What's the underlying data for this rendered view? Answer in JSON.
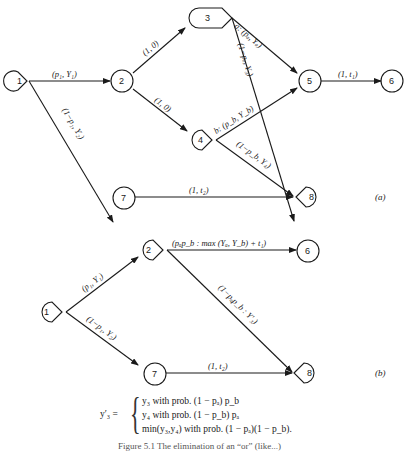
{
  "panel_a": {
    "label": "(a)",
    "nodes": {
      "n1": "1",
      "n2": "2",
      "n3": "3",
      "n4": "4",
      "n5": "5",
      "n6": "6",
      "n7": "7",
      "n8": "8"
    },
    "edges": {
      "e1_2": "(p₁, Y₁)",
      "e1_7": "(1−p₁, Y₂)",
      "e2_3": "(1, 0)",
      "e2_4": "(1, 0)",
      "e3_5": "a: (pₐ, Yₐ)",
      "e3_8": "(1−pₐ, Y₃)",
      "e4_5": "b: (p_b, Y_b)",
      "e4_8": "(1−p_b, Y₄)",
      "e5_6": "(1, t₁)",
      "e7_8": "(1, t₂)"
    }
  },
  "panel_b": {
    "label": "(b)",
    "nodes": {
      "n1": "1",
      "n2": "2",
      "n6": "6",
      "n7": "7",
      "n8": "8"
    },
    "edges": {
      "e1_2": "(p₁, Y₁)",
      "e1_7": "(1−p₁, Y₂)",
      "e2_6": "(pₐp_b : max (Yₐ, Y_b) + t₁)",
      "e2_8": "(1−pₐp_b : Y′₃)",
      "e7_8": "(1, t₂)"
    }
  },
  "formula": {
    "lhs": "y′₃ =",
    "cases": [
      "y₃ with prob. (1 − pₐ) p_b",
      "y₄ with prob. (1 − p_b) pₐ",
      "min(y₃,y₄) with prob. (1 − pₐ)(1 − p_b)."
    ]
  },
  "caption": "Figure 5.1  The elimination of an “or” (like...)"
}
